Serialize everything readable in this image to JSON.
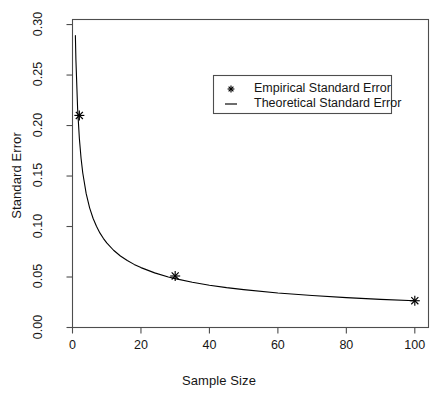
{
  "figure": {
    "background": "#ffffff",
    "foreground": "#1a1a1a",
    "title": ""
  },
  "chart_data": {
    "type": "line",
    "title": "",
    "xlabel": "Sample Size",
    "ylabel": "Standard Error",
    "xlim": [
      0,
      104
    ],
    "ylim": [
      0.0,
      0.305
    ],
    "grid": false,
    "xticks": [
      0,
      20,
      40,
      60,
      80,
      100
    ],
    "xticklabels": [
      "0",
      "20",
      "40",
      "60",
      "80",
      "100"
    ],
    "yticks": [
      0.0,
      0.05,
      0.1,
      0.15,
      0.2,
      0.25,
      0.3
    ],
    "yticklabels": [
      "0.00",
      "0.05",
      "0.10",
      "0.15",
      "0.20",
      "0.25",
      "0.30"
    ],
    "legend": {
      "position": "upper-center-right",
      "entries": [
        {
          "label": "Empirical Standard Error",
          "marker": "star",
          "color": "#000000"
        },
        {
          "label": "Theoretical Standard Error",
          "marker": "line",
          "color": "#000000"
        }
      ]
    },
    "series": [
      {
        "name": "Empirical Standard Error",
        "type": "scatter",
        "marker": "star",
        "color": "#000000",
        "x": [
          2,
          30,
          100
        ],
        "y": [
          0.21,
          0.051,
          0.0265
        ]
      },
      {
        "name": "Theoretical Standard Error",
        "type": "line",
        "color": "#000000",
        "formula": "0.265 / sqrt(n)",
        "x": [
          0.84,
          1,
          1.5,
          2,
          2.5,
          3,
          4,
          5,
          6,
          7,
          8,
          9,
          10,
          12,
          14,
          16,
          18,
          20,
          24,
          28,
          30,
          35,
          40,
          45,
          50,
          60,
          70,
          80,
          90,
          100
        ],
        "y": [
          0.289,
          0.265,
          0.2164,
          0.1874,
          0.1676,
          0.153,
          0.1325,
          0.1185,
          0.1082,
          0.1002,
          0.0937,
          0.0883,
          0.0838,
          0.0765,
          0.0708,
          0.0663,
          0.0625,
          0.0593,
          0.0541,
          0.0501,
          0.0484,
          0.0448,
          0.0419,
          0.0395,
          0.0375,
          0.0342,
          0.0317,
          0.0296,
          0.0279,
          0.0265
        ]
      }
    ]
  }
}
